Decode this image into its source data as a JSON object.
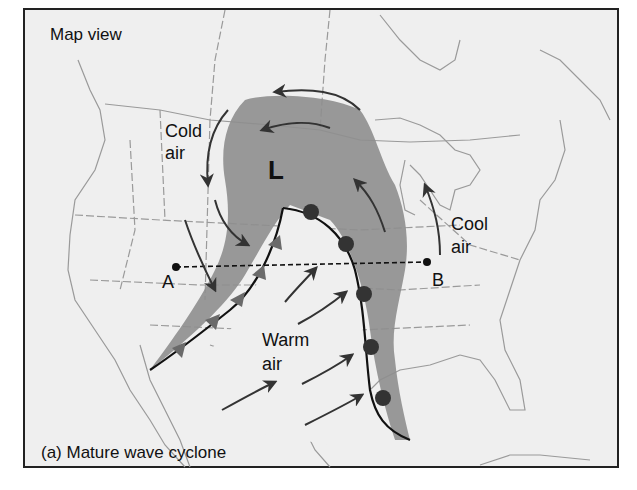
{
  "diagram": {
    "title": "Map view",
    "caption": "(a) Mature wave cyclone",
    "low_pressure_symbol": "L",
    "air_masses": {
      "cold": [
        "Cold",
        "air"
      ],
      "cool": [
        "Cool",
        "air"
      ],
      "warm": [
        "Warm",
        "air"
      ]
    },
    "cross_section": {
      "start_label": "A",
      "end_label": "B"
    },
    "fronts": [
      {
        "type": "cold-front",
        "symbol": "triangles"
      },
      {
        "type": "warm-front",
        "symbol": "semicircles"
      }
    ],
    "colors": {
      "background": "#efefef",
      "border": "#222222",
      "precip_shading": "#8e8e8e",
      "front_fill": "#6a6a6a",
      "map_lines": "#9a9a9a",
      "arrow": "#333333"
    }
  }
}
